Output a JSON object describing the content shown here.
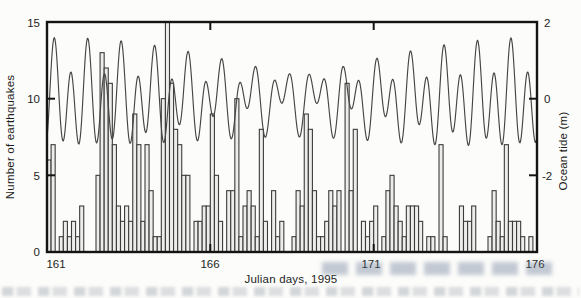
{
  "figure": {
    "xlabel": "Julian days, 1995",
    "ylabel_left": "Number of earthquakes",
    "ylabel_right": "Ocean tide (m)",
    "x_tick_labels": [
      "161",
      "166",
      "171",
      "176"
    ],
    "left_tick_labels": [
      "15",
      "10",
      "5",
      "0"
    ],
    "right_tick_labels": [
      "2",
      "0",
      "-2"
    ],
    "colors": {
      "axis": "#141414",
      "bar_fill": "#ededeb",
      "bar_stroke": "#3c3c3c",
      "tide_line": "#454545",
      "background": "#fcfcfa"
    }
  },
  "chart_data": [
    {
      "type": "bar",
      "name": "earthquake-count-histogram",
      "title": "",
      "xlabel": "Julian days, 1995",
      "ylabel": "Number of earthquakes",
      "x_range": [
        161,
        176
      ],
      "ylim": [
        0,
        15
      ],
      "x_ticks": [
        161,
        166,
        171,
        176
      ],
      "y_ticks": [
        0,
        5,
        10,
        15
      ],
      "grid": false,
      "bins_start_day": 161.0,
      "bin_width_days": 0.125,
      "values": [
        6,
        7,
        0,
        1,
        2,
        1,
        2,
        1,
        3,
        0,
        0,
        0,
        5,
        13,
        12,
        11,
        7,
        3,
        2,
        3,
        2,
        9,
        7,
        2,
        7,
        4,
        1,
        1,
        10,
        15,
        11,
        8,
        7,
        5,
        5,
        0,
        2,
        2,
        3,
        3,
        9,
        5,
        2,
        0,
        4,
        4,
        10,
        1,
        3,
        4,
        3,
        1,
        8,
        2,
        0,
        4,
        1,
        2,
        0,
        0,
        1,
        4,
        3,
        9,
        8,
        4,
        1,
        1,
        2,
        4,
        3,
        4,
        0,
        11,
        4,
        8,
        0,
        2,
        1,
        2,
        3,
        0,
        1,
        4,
        5,
        3,
        2,
        1,
        3,
        3,
        3,
        2,
        0,
        1,
        1,
        0,
        7,
        1,
        0,
        0,
        0,
        3,
        2,
        2,
        3,
        0,
        0,
        0,
        1,
        4,
        2,
        1,
        7,
        2,
        2,
        2,
        1,
        0,
        1,
        0
      ]
    },
    {
      "type": "line",
      "name": "ocean-tide-curve",
      "title": "",
      "ylabel": "Ocean tide (m)",
      "x_range": [
        161,
        176
      ],
      "right_axis_ticks": [
        2,
        0,
        -2
      ],
      "right_axis_top_value": 2,
      "right_axis_meters_per_left_unit": 0.4,
      "legend": "none",
      "tide_model": {
        "note": "mixed semidiurnal tide, spring at ~day 161.2 and neap at ~day 168.6",
        "sample_step_days": 0.02,
        "constituents": [
          {
            "name": "M2",
            "amplitude_m": 0.85,
            "period_days": 0.51753,
            "peak_day": 161.22
          },
          {
            "name": "S2",
            "amplitude_m": 0.3,
            "period_days": 0.5,
            "peak_day": 161.22
          },
          {
            "name": "K1",
            "amplitude_m": 0.45,
            "period_days": 0.9973,
            "peak_day": 161.25
          }
        ]
      }
    }
  ]
}
